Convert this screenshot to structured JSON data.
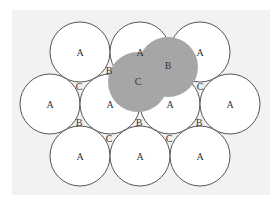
{
  "diagram": {
    "background": "#f2f2f2",
    "circle_fill": "#ffffff",
    "circle_stroke": "#555555",
    "shaded_fill": "#a6a6a6",
    "radius": 30,
    "white_circles": [
      {
        "cx": 80,
        "cy": 52,
        "label": "A"
      },
      {
        "cx": 140,
        "cy": 52,
        "label": "A"
      },
      {
        "cx": 200,
        "cy": 52,
        "label": "A"
      },
      {
        "cx": 50,
        "cy": 104,
        "label": "A"
      },
      {
        "cx": 110,
        "cy": 104,
        "label": "A"
      },
      {
        "cx": 170,
        "cy": 104,
        "label": "A"
      },
      {
        "cx": 230,
        "cy": 104,
        "label": "A"
      },
      {
        "cx": 80,
        "cy": 156,
        "label": "A"
      },
      {
        "cx": 140,
        "cy": 156,
        "label": "A"
      },
      {
        "cx": 200,
        "cy": 156,
        "label": "A"
      }
    ],
    "shaded_circles": [
      {
        "cx": 138,
        "cy": 82,
        "label": "C"
      },
      {
        "cx": 168,
        "cy": 67,
        "label": "B"
      }
    ],
    "labels": {
      "a_top_left": "A",
      "a_top_mid": "A",
      "a_top_right": "A",
      "a_mid_1": "A",
      "a_mid_2": "A",
      "a_mid_3": "A",
      "a_mid_4": "A",
      "a_bot_left": "A",
      "a_bot_mid": "A",
      "a_bot_right": "A",
      "shaded_c": "C",
      "shaded_b": "B",
      "gap_b_top": "B",
      "gap_c_top_left": "C",
      "gap_c_top_right": "C",
      "gap_b_bot_1": "B",
      "gap_b_bot_2": "B",
      "gap_b_bot_3": "B",
      "gap_c_bot_1": "C",
      "gap_c_bot_2": "C"
    }
  }
}
